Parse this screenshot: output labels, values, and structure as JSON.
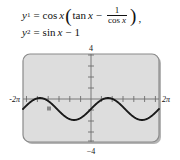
{
  "figure": {
    "kind": "graphing-calculator-plot"
  },
  "equations": {
    "line1": {
      "lhs": "y",
      "lhs_sub": "1",
      "equals": "=",
      "fn1": "cos",
      "fn1_arg": "x",
      "open_paren": "(",
      "fn2": "tan",
      "fn2_arg": "x",
      "minus": "−",
      "numerator": "1",
      "denominator_fn": "cos",
      "denominator_arg": "x",
      "close_paren": ")",
      "comma": ","
    },
    "line2": {
      "lhs": "y",
      "lhs_sub": "2",
      "equals": "=",
      "fn": "sin",
      "fn_arg": "x",
      "minus": "−",
      "constant": "1"
    }
  },
  "plot": {
    "x_min_label": "-2π",
    "x_max_label": "2π",
    "y_max_label": "4",
    "y_min_label": "−4",
    "frame_fill": "#dddddd",
    "frame_stroke": "#8a8a8a",
    "axis_color": "#6e6e6e",
    "curve_color": "#1a1a1a",
    "shadow_color": "#b4b4b4"
  },
  "chart_data": {
    "type": "line",
    "title": "",
    "xlabel": "",
    "ylabel": "",
    "xlim": [
      -6.283185307,
      6.283185307
    ],
    "ylim": [
      -4,
      4
    ],
    "xtick_labels": [
      "-2π",
      "2π"
    ],
    "ytick_labels": [
      "4",
      "−4"
    ],
    "xtick_values": [
      -6.283185307,
      6.283185307
    ],
    "ytick_values": [
      4,
      -4
    ],
    "x_tick_step": 1,
    "y_tick_step": 1,
    "grid": false,
    "legend": "none",
    "series": [
      {
        "name": "y1 = cos x (tan x - 1/cos x)  =  y2 = sin x - 1",
        "expression": "sin(x) - 1",
        "amplitude": 1,
        "vertical_shift": -1,
        "y_max": 0,
        "y_min": -2,
        "x": [
          -6.2832,
          -5.8905,
          -5.4978,
          -5.1051,
          -4.7124,
          -4.3197,
          -3.927,
          -3.5343,
          -3.1416,
          -2.7489,
          -2.3562,
          -1.9635,
          -1.5708,
          -1.1781,
          -0.7854,
          -0.3927,
          0,
          0.3927,
          0.7854,
          1.1781,
          1.5708,
          1.9635,
          2.3562,
          2.7489,
          3.1416,
          3.5343,
          3.927,
          4.3197,
          4.7124,
          5.1051,
          5.4978,
          5.8905,
          6.2832
        ],
        "y": [
          -1,
          -0.6173,
          -0.2929,
          -0.0761,
          0,
          -0.0761,
          -0.2929,
          -0.6173,
          -1,
          -1.3827,
          -1.7071,
          -1.9239,
          -2,
          -1.9239,
          -1.7071,
          -1.3827,
          -1,
          -0.6173,
          -0.2929,
          -0.0761,
          0,
          -0.0761,
          -0.2929,
          -0.6173,
          -1,
          -1.3827,
          -1.7071,
          -1.9239,
          -2,
          -1.9239,
          -1.7071,
          -1.3827,
          -1
        ]
      }
    ]
  }
}
